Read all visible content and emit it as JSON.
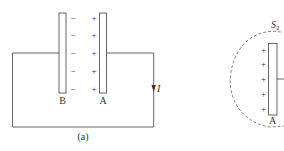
{
  "diagram": {
    "panel_a": {
      "caption": "(a)",
      "plate_b_label": "B",
      "plate_a_label": "A",
      "plate_b_charges": [
        "−",
        "−",
        "−",
        "−",
        "−"
      ],
      "plate_a_charges": [
        "+",
        "+",
        "+",
        "+",
        "+"
      ],
      "current_label": "I"
    },
    "panel_b": {
      "surface_label": "S",
      "surface_subscript": "2",
      "plate_label": "A",
      "plate_charges": [
        "+",
        "+",
        "+",
        "+",
        "+"
      ]
    },
    "colors": {
      "line": "#555555",
      "text": "#333333",
      "background": "#ffffff"
    }
  }
}
